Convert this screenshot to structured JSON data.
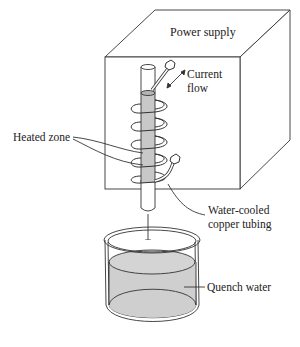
{
  "figure": {
    "type": "induction-hardening-apparatus",
    "labels": {
      "power_supply": "Power supply",
      "current_flow_line1": "Current",
      "current_flow_line2": "flow",
      "heated_zone": "Heated zone",
      "copper_tubing_line1": "Water-cooled",
      "copper_tubing_line2": "copper tubing",
      "quench_water": "Quench water"
    },
    "colors": {
      "line": "#333333",
      "heated_fill": "#c8c8c8",
      "water_fill": "#cfcfcf",
      "background": "#ffffff"
    }
  }
}
